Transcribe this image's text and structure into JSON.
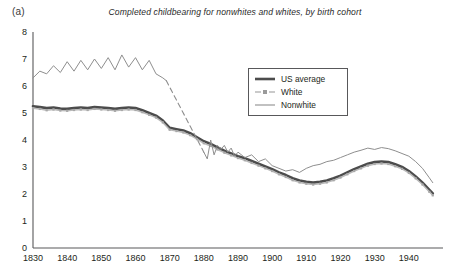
{
  "panel": {
    "label": "(a)"
  },
  "legend": {
    "position": "inside-upper-right",
    "items": [
      {
        "label": "US average",
        "color": "#4c4c4c",
        "style": "thick-solid",
        "marker": "none"
      },
      {
        "label": "White",
        "color": "#b9b9b9",
        "style": "dashed-light",
        "marker": "square"
      },
      {
        "label": "Nonwhite",
        "color": "#8e8e8e",
        "style": "thin-solid",
        "marker": "none"
      }
    ]
  },
  "colors": {
    "us_average": "#4c4c4c",
    "white": "#b9b9b9",
    "nonwhite": "#8e8e8e",
    "axis": "#58585a",
    "text": "#231f20"
  },
  "chart_data": {
    "type": "line",
    "title": "Completed childbearing for nonwhites and whites, by birth cohort",
    "xlabel": "",
    "ylabel": "",
    "xlim": [
      1830,
      1950
    ],
    "ylim": [
      0,
      8
    ],
    "yticks": [
      0,
      1,
      2,
      3,
      4,
      5,
      6,
      7,
      8
    ],
    "xticks": [
      1830,
      1840,
      1850,
      1860,
      1870,
      1880,
      1890,
      1900,
      1910,
      1920,
      1930,
      1940
    ],
    "grid": false,
    "series": [
      {
        "name": "US average",
        "color": "#4c4c4c",
        "x": [
          1830,
          1832,
          1834,
          1836,
          1838,
          1840,
          1842,
          1844,
          1846,
          1848,
          1850,
          1852,
          1854,
          1856,
          1858,
          1860,
          1862,
          1864,
          1866,
          1868,
          1870,
          1872,
          1874,
          1876,
          1878,
          1880,
          1882,
          1884,
          1886,
          1888,
          1890,
          1892,
          1894,
          1896,
          1898,
          1900,
          1902,
          1904,
          1906,
          1908,
          1910,
          1912,
          1914,
          1916,
          1918,
          1920,
          1922,
          1924,
          1926,
          1928,
          1930,
          1932,
          1934,
          1936,
          1938,
          1940,
          1942,
          1944,
          1946,
          1947
        ],
        "values": [
          5.25,
          5.22,
          5.18,
          5.2,
          5.16,
          5.15,
          5.18,
          5.2,
          5.18,
          5.22,
          5.2,
          5.18,
          5.15,
          5.18,
          5.2,
          5.18,
          5.1,
          5.0,
          4.9,
          4.72,
          4.45,
          4.4,
          4.35,
          4.25,
          4.1,
          3.95,
          3.85,
          3.72,
          3.6,
          3.5,
          3.4,
          3.32,
          3.22,
          3.12,
          3.02,
          2.92,
          2.8,
          2.7,
          2.58,
          2.5,
          2.45,
          2.42,
          2.45,
          2.5,
          2.58,
          2.68,
          2.8,
          2.92,
          3.02,
          3.12,
          3.18,
          3.2,
          3.18,
          3.1,
          3.0,
          2.85,
          2.65,
          2.42,
          2.15,
          2.02
        ]
      },
      {
        "name": "White",
        "color": "#b9b9b9",
        "x": [
          1830,
          1832,
          1834,
          1836,
          1838,
          1840,
          1842,
          1844,
          1846,
          1848,
          1850,
          1852,
          1854,
          1856,
          1858,
          1860,
          1862,
          1864,
          1866,
          1868,
          1870,
          1872,
          1874,
          1876,
          1878,
          1880,
          1882,
          1884,
          1886,
          1888,
          1890,
          1892,
          1894,
          1896,
          1898,
          1900,
          1902,
          1904,
          1906,
          1908,
          1910,
          1912,
          1914,
          1916,
          1918,
          1920,
          1922,
          1924,
          1926,
          1928,
          1930,
          1932,
          1934,
          1936,
          1938,
          1940,
          1942,
          1944,
          1946,
          1947
        ],
        "values": [
          5.18,
          5.15,
          5.1,
          5.13,
          5.09,
          5.08,
          5.11,
          5.13,
          5.11,
          5.15,
          5.13,
          5.11,
          5.08,
          5.11,
          5.13,
          5.11,
          5.03,
          4.93,
          4.83,
          4.65,
          4.38,
          4.33,
          4.28,
          4.18,
          4.03,
          3.88,
          3.78,
          3.65,
          3.53,
          3.43,
          3.33,
          3.25,
          3.15,
          3.05,
          2.95,
          2.85,
          2.73,
          2.63,
          2.51,
          2.43,
          2.38,
          2.35,
          2.38,
          2.43,
          2.51,
          2.61,
          2.73,
          2.85,
          2.95,
          3.05,
          3.11,
          3.13,
          3.11,
          3.03,
          2.93,
          2.78,
          2.58,
          2.35,
          2.08,
          1.95
        ]
      },
      {
        "name": "Nonwhite (observed, early)",
        "color": "#8e8e8e",
        "x": [
          1830,
          1832,
          1834,
          1836,
          1838,
          1840,
          1842,
          1844,
          1846,
          1848,
          1850,
          1852,
          1854,
          1856,
          1858,
          1860,
          1862,
          1864,
          1866,
          1868,
          1869
        ],
        "values": [
          6.3,
          6.55,
          6.45,
          6.75,
          6.5,
          6.9,
          6.55,
          6.95,
          6.6,
          7.0,
          6.65,
          7.05,
          6.6,
          7.15,
          6.7,
          7.05,
          6.6,
          6.95,
          6.45,
          6.3,
          6.2
        ]
      },
      {
        "name": "Nonwhite (interpolated)",
        "color": "#8e8e8e",
        "style": "dashed",
        "x": [
          1869,
          1880
        ],
        "values": [
          6.2,
          3.55
        ]
      },
      {
        "name": "Nonwhite (observed, late)",
        "color": "#8e8e8e",
        "x": [
          1880,
          1881,
          1882,
          1883,
          1884,
          1885,
          1886,
          1887,
          1888,
          1889,
          1890,
          1892,
          1894,
          1896,
          1898,
          1900,
          1902,
          1904,
          1906,
          1908,
          1910,
          1912,
          1914,
          1916,
          1918,
          1920,
          1922,
          1924,
          1926,
          1928,
          1930,
          1932,
          1934,
          1936,
          1938,
          1940,
          1942,
          1944,
          1946,
          1947
        ],
        "values": [
          3.55,
          3.3,
          4.0,
          3.45,
          3.8,
          3.65,
          3.8,
          3.55,
          3.7,
          3.4,
          3.55,
          3.35,
          3.45,
          3.2,
          3.3,
          3.05,
          2.95,
          2.85,
          2.9,
          2.8,
          2.95,
          3.05,
          3.1,
          3.2,
          3.25,
          3.35,
          3.45,
          3.55,
          3.62,
          3.7,
          3.65,
          3.72,
          3.68,
          3.6,
          3.5,
          3.4,
          3.2,
          2.95,
          2.6,
          2.42
        ]
      }
    ]
  }
}
